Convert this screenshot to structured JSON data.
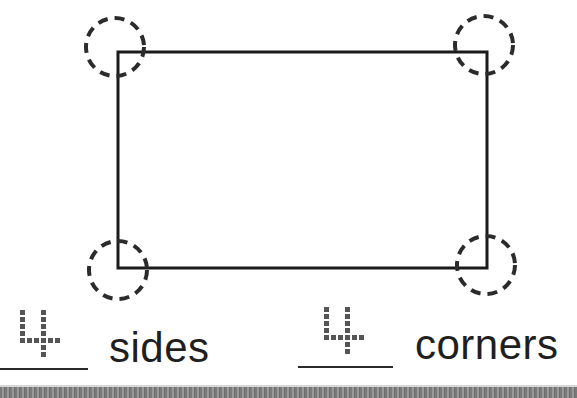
{
  "worksheet": {
    "shape": {
      "name": "rectangle",
      "rect": {
        "x": 118,
        "y": 52,
        "width": 369,
        "height": 216
      },
      "stroke_color": "#1a1a1a",
      "corner_markers": [
        {
          "corner": "top-left",
          "cx": 115,
          "cy": 47,
          "r": 29
        },
        {
          "corner": "top-right",
          "cx": 484,
          "cy": 45,
          "r": 29
        },
        {
          "corner": "bottom-left",
          "cx": 118,
          "cy": 270,
          "r": 29
        },
        {
          "corner": "bottom-right",
          "cx": 486,
          "cy": 265,
          "r": 29
        }
      ],
      "marker_color": "#2b2b2b"
    },
    "answers": [
      {
        "value": "4",
        "label": "sides"
      },
      {
        "value": "4",
        "label": "corners"
      }
    ]
  }
}
